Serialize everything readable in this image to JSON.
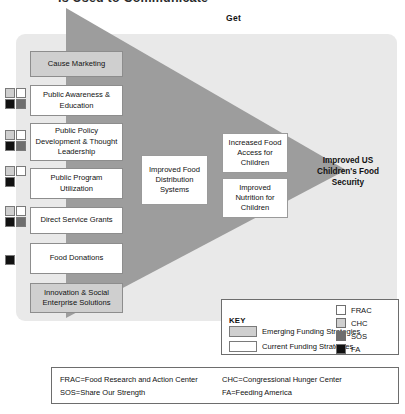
{
  "header": {
    "cut_off_title": "is Used to Communicate",
    "column_left_label": "Do",
    "column_right_label": "Get"
  },
  "colors": {
    "emerging_fill": "#cfcfcf",
    "current_fill": "#ffffff",
    "panel_bg": "#e9e9e9",
    "funnel_dark": "#9d9d9d",
    "frac": "#ffffff",
    "chc": "#cfcfcf",
    "sos": "#6e6e6e",
    "fa": "#111111"
  },
  "strategies": [
    {
      "label": "Cause Marketing",
      "type": "emerging",
      "funders": [
        "chc",
        "frac",
        "fa",
        "sos"
      ],
      "top": 51,
      "height": 26,
      "swatch_top": 0,
      "swatches": []
    },
    {
      "label": "Public Awareness & Education",
      "type": "current",
      "funders": [
        "chc",
        "frac",
        "fa",
        "sos"
      ],
      "top": 85,
      "height": 31,
      "swatch_top": 88,
      "swatches": [
        "chc",
        "frac",
        "fa",
        "sos"
      ]
    },
    {
      "label": "Public Policy Development & Thought Leadership",
      "type": "current",
      "funders": [
        "chc",
        "frac",
        "fa",
        "sos"
      ],
      "top": 123,
      "height": 38,
      "swatch_top": 130,
      "swatches": [
        "chc",
        "frac",
        "fa",
        "sos"
      ]
    },
    {
      "label": "Public Program Utilization",
      "type": "current",
      "funders": [
        "chc",
        "frac",
        "fa"
      ],
      "top": 168,
      "height": 31,
      "swatch_top": 166,
      "swatches": [
        "chc",
        "frac",
        "fa"
      ]
    },
    {
      "label": "Direct Service Grants",
      "type": "current",
      "funders": [
        "chc",
        "frac",
        "fa",
        "sos"
      ],
      "top": 207,
      "height": 27,
      "swatch_top": 206,
      "swatches": [
        "chc",
        "frac",
        "fa",
        "sos"
      ]
    },
    {
      "label": "Food Donations",
      "type": "current",
      "funders": [
        "fa"
      ],
      "top": 243,
      "height": 31,
      "swatch_top": 255,
      "swatches": [
        "fa"
      ]
    },
    {
      "label": "Innovation & Social Enterprise Solutions",
      "type": "emerging",
      "funders": [],
      "top": 283,
      "height": 30,
      "swatch_top": 0,
      "swatches": []
    }
  ],
  "outcomes": [
    {
      "label": "Improved Food Distribution Systems",
      "left": 141,
      "top": 155,
      "width": 67,
      "height": 50
    },
    {
      "label": "Increased Food Access for Children",
      "left": 222,
      "top": 133,
      "width": 66,
      "height": 40
    },
    {
      "label": "Improved Nutrition for Children",
      "left": 222,
      "top": 178,
      "width": 66,
      "height": 40
    }
  ],
  "goal": {
    "label": "Improved US Children's Food Security"
  },
  "key": {
    "title": "KEY",
    "rows": [
      {
        "label": "Emerging Funding Strategies",
        "style": "emerging"
      },
      {
        "label": "Current Funding Strategies",
        "style": "current"
      }
    ],
    "organizations": [
      {
        "abbr": "FRAC",
        "color": "#ffffff"
      },
      {
        "abbr": "CHC",
        "color": "#cfcfcf"
      },
      {
        "abbr": "SOS",
        "color": "#6e6e6e"
      },
      {
        "abbr": "FA",
        "color": "#111111"
      }
    ]
  },
  "footnotes": {
    "frac": "FRAC=Food Research and Action Center",
    "sos": "SOS=Share Our Strength",
    "chc": "CHC=Congressional Hunger Center",
    "fa": "FA=Feeding America"
  }
}
